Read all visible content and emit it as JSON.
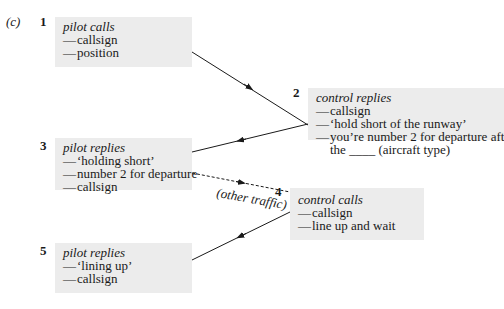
{
  "figure_label": "(c)",
  "steps": [
    {
      "number": "1",
      "title": "pilot calls",
      "items": [
        "callsign",
        "position"
      ]
    },
    {
      "number": "2",
      "title": "control replies",
      "items": [
        "callsign",
        "‘hold short of the runway’",
        "you’re number 2 for departure after"
      ],
      "continuation": "the ____ (aircraft type)"
    },
    {
      "number": "3",
      "title": "pilot replies",
      "items": [
        "‘holding short’",
        "number 2 for departure",
        "callsign"
      ]
    },
    {
      "number": "4",
      "title": "control calls",
      "items": [
        "callsign",
        "line up and wait"
      ]
    },
    {
      "number": "5",
      "title": "pilot replies",
      "items": [
        "‘lining up’",
        "callsign"
      ]
    }
  ],
  "dash_glyph": "—",
  "other_traffic_label": "(other traffic)",
  "colors": {
    "box_fill": "#ececec",
    "line": "#1a1a1a",
    "background": "#ffffff"
  }
}
